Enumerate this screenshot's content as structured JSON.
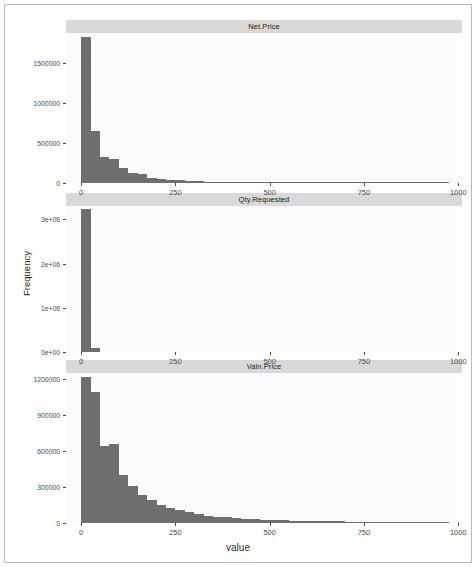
{
  "chart_data": {
    "type": "bar",
    "title": "",
    "xlabel": "value",
    "ylabel": "Frequency",
    "grid": true,
    "legend": "none",
    "facet_layout": "3 rows x 1 column, free y scales, shared x scale",
    "bar_color": "#6e6e6e",
    "panel_background": "#fbfbfb",
    "strip_background": "#d9d9d9",
    "xlim": [
      -40,
      1010
    ],
    "x_ticks": [
      0,
      250,
      500,
      750,
      1000
    ],
    "x_tick_labels": [
      "0",
      "250",
      "500",
      "750",
      "1000"
    ],
    "binwidth": 25,
    "panels": [
      {
        "name": "net-price",
        "strip_label": "Net.Price",
        "ylim": [
          0,
          1880000
        ],
        "y_ticks": [
          0,
          500000,
          1000000,
          1500000
        ],
        "y_tick_labels": [
          "0",
          "500000",
          "1000000",
          "1500000"
        ],
        "bins": [
          {
            "x0": 0,
            "x1": 25,
            "count": 1830000
          },
          {
            "x0": 25,
            "x1": 50,
            "count": 650000
          },
          {
            "x0": 50,
            "x1": 75,
            "count": 320000
          },
          {
            "x0": 75,
            "x1": 100,
            "count": 300000
          },
          {
            "x0": 100,
            "x1": 125,
            "count": 185000
          },
          {
            "x0": 125,
            "x1": 150,
            "count": 120000
          },
          {
            "x0": 150,
            "x1": 175,
            "count": 110000
          },
          {
            "x0": 175,
            "x1": 200,
            "count": 68000
          },
          {
            "x0": 200,
            "x1": 225,
            "count": 46000
          },
          {
            "x0": 225,
            "x1": 250,
            "count": 40000
          },
          {
            "x0": 250,
            "x1": 275,
            "count": 34000
          },
          {
            "x0": 275,
            "x1": 300,
            "count": 30000
          },
          {
            "x0": 300,
            "x1": 325,
            "count": 24000
          },
          {
            "x0": 325,
            "x1": 350,
            "count": 16000
          },
          {
            "x0": 350,
            "x1": 375,
            "count": 14000
          },
          {
            "x0": 375,
            "x1": 400,
            "count": 12000
          },
          {
            "x0": 400,
            "x1": 425,
            "count": 10000
          },
          {
            "x0": 425,
            "x1": 450,
            "count": 9000
          },
          {
            "x0": 450,
            "x1": 475,
            "count": 8000
          },
          {
            "x0": 475,
            "x1": 500,
            "count": 7000
          },
          {
            "x0": 500,
            "x1": 525,
            "count": 6500
          },
          {
            "x0": 525,
            "x1": 550,
            "count": 6000
          },
          {
            "x0": 550,
            "x1": 575,
            "count": 5500
          },
          {
            "x0": 575,
            "x1": 600,
            "count": 5000
          },
          {
            "x0": 600,
            "x1": 625,
            "count": 4500
          },
          {
            "x0": 625,
            "x1": 650,
            "count": 4200
          },
          {
            "x0": 650,
            "x1": 675,
            "count": 4000
          },
          {
            "x0": 675,
            "x1": 700,
            "count": 3800
          },
          {
            "x0": 700,
            "x1": 725,
            "count": 3500
          },
          {
            "x0": 725,
            "x1": 750,
            "count": 3200
          },
          {
            "x0": 750,
            "x1": 775,
            "count": 3000
          },
          {
            "x0": 775,
            "x1": 800,
            "count": 2800
          },
          {
            "x0": 800,
            "x1": 825,
            "count": 2600
          },
          {
            "x0": 825,
            "x1": 850,
            "count": 2400
          },
          {
            "x0": 850,
            "x1": 875,
            "count": 2200
          },
          {
            "x0": 875,
            "x1": 900,
            "count": 2000
          },
          {
            "x0": 900,
            "x1": 925,
            "count": 1800
          },
          {
            "x0": 925,
            "x1": 950,
            "count": 1600
          },
          {
            "x0": 950,
            "x1": 975,
            "count": 1400
          }
        ]
      },
      {
        "name": "qty-requested",
        "strip_label": "Qty.Requested",
        "ylim": [
          0,
          3300000
        ],
        "y_ticks": [
          0,
          1000000,
          2000000,
          3000000
        ],
        "y_tick_labels": [
          "0e+00",
          "1e+06",
          "2e+06",
          "3e+06"
        ],
        "bins": [
          {
            "x0": 0,
            "x1": 25,
            "count": 3230000
          },
          {
            "x0": 25,
            "x1": 50,
            "count": 95000
          }
        ]
      },
      {
        "name": "valn-price",
        "strip_label": "Valn.Price",
        "ylim": [
          0,
          1250000
        ],
        "y_ticks": [
          0,
          300000,
          600000,
          900000,
          1200000
        ],
        "y_tick_labels": [
          "0",
          "300000",
          "600000",
          "900000",
          "1200000"
        ],
        "bins": [
          {
            "x0": 0,
            "x1": 25,
            "count": 1220000
          },
          {
            "x0": 25,
            "x1": 50,
            "count": 1090000
          },
          {
            "x0": 50,
            "x1": 75,
            "count": 640000
          },
          {
            "x0": 75,
            "x1": 100,
            "count": 660000
          },
          {
            "x0": 100,
            "x1": 125,
            "count": 400000
          },
          {
            "x0": 125,
            "x1": 150,
            "count": 310000
          },
          {
            "x0": 150,
            "x1": 175,
            "count": 230000
          },
          {
            "x0": 175,
            "x1": 200,
            "count": 195000
          },
          {
            "x0": 200,
            "x1": 225,
            "count": 150000
          },
          {
            "x0": 225,
            "x1": 250,
            "count": 128000
          },
          {
            "x0": 250,
            "x1": 275,
            "count": 105000
          },
          {
            "x0": 275,
            "x1": 300,
            "count": 88000
          },
          {
            "x0": 300,
            "x1": 325,
            "count": 74000
          },
          {
            "x0": 325,
            "x1": 350,
            "count": 62000
          },
          {
            "x0": 350,
            "x1": 375,
            "count": 54000
          },
          {
            "x0": 375,
            "x1": 400,
            "count": 46000
          },
          {
            "x0": 400,
            "x1": 425,
            "count": 40000
          },
          {
            "x0": 425,
            "x1": 450,
            "count": 35000
          },
          {
            "x0": 450,
            "x1": 475,
            "count": 31000
          },
          {
            "x0": 475,
            "x1": 500,
            "count": 28000
          },
          {
            "x0": 500,
            "x1": 525,
            "count": 25000
          },
          {
            "x0": 525,
            "x1": 550,
            "count": 22000
          },
          {
            "x0": 550,
            "x1": 575,
            "count": 20000
          },
          {
            "x0": 575,
            "x1": 600,
            "count": 18000
          },
          {
            "x0": 600,
            "x1": 625,
            "count": 16000
          },
          {
            "x0": 625,
            "x1": 650,
            "count": 15000
          },
          {
            "x0": 650,
            "x1": 675,
            "count": 14000
          },
          {
            "x0": 675,
            "x1": 700,
            "count": 13000
          },
          {
            "x0": 700,
            "x1": 725,
            "count": 12000
          },
          {
            "x0": 725,
            "x1": 750,
            "count": 11000
          },
          {
            "x0": 750,
            "x1": 775,
            "count": 10000
          },
          {
            "x0": 775,
            "x1": 800,
            "count": 9000
          },
          {
            "x0": 800,
            "x1": 825,
            "count": 8000
          },
          {
            "x0": 825,
            "x1": 850,
            "count": 7000
          },
          {
            "x0": 850,
            "x1": 875,
            "count": 6000
          },
          {
            "x0": 875,
            "x1": 900,
            "count": 5000
          },
          {
            "x0": 900,
            "x1": 925,
            "count": 4000
          },
          {
            "x0": 925,
            "x1": 950,
            "count": 3000
          },
          {
            "x0": 950,
            "x1": 975,
            "count": 2000
          }
        ]
      }
    ]
  }
}
